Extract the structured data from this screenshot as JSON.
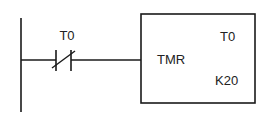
{
  "diagram": {
    "type": "ladder-logic",
    "contact": {
      "label": "T0",
      "kind": "normally-closed"
    },
    "timer_block": {
      "instruction": "TMR",
      "timer_id": "T0",
      "preset": "K20"
    },
    "colors": {
      "line": "#1a1a1a",
      "text": "#222222",
      "background": "#ffffff"
    }
  }
}
